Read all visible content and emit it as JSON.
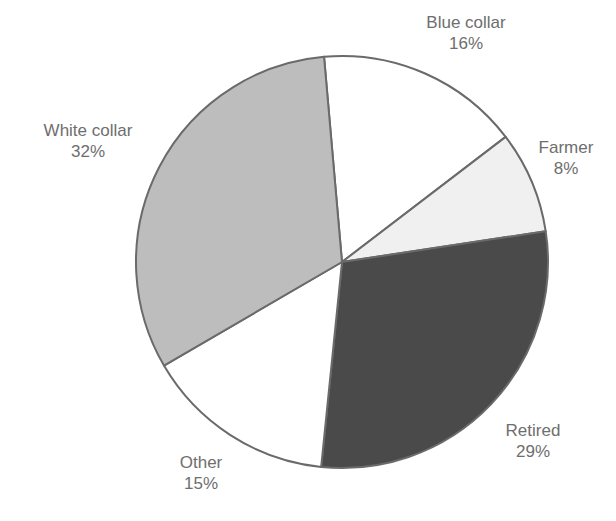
{
  "chart_data": {
    "type": "pie",
    "title": "",
    "start_angle_deg": -5,
    "direction": "clockwise",
    "center": [
      342,
      262
    ],
    "radius": 206,
    "stroke_color": "#6a6a6a",
    "slices": [
      {
        "label": "Blue collar",
        "value": 16,
        "display": "16%",
        "color": "#ffffff",
        "label_pos": [
          466,
          12
        ]
      },
      {
        "label": "Farmer",
        "value": 8,
        "display": "8%",
        "color": "#f0f0f0",
        "label_pos": [
          566,
          137
        ]
      },
      {
        "label": "Retired",
        "value": 29,
        "display": "29%",
        "color": "#4a4a4a",
        "label_pos": [
          533,
          420
        ]
      },
      {
        "label": "Other",
        "value": 15,
        "display": "15%",
        "color": "#ffffff",
        "label_pos": [
          201,
          452
        ]
      },
      {
        "label": "White collar",
        "value": 32,
        "display": "32%",
        "color": "#bdbdbd",
        "label_pos": [
          88,
          120
        ]
      }
    ]
  }
}
